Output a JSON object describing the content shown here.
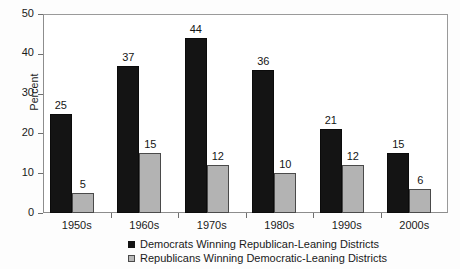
{
  "chart_data": {
    "type": "bar",
    "title": "",
    "xlabel": "",
    "ylabel": "Percent",
    "ylim": [
      0,
      50
    ],
    "yticks": [
      0,
      10,
      20,
      30,
      40,
      50
    ],
    "grid": false,
    "legend_position": "bottom",
    "categories": [
      "1950s",
      "1960s",
      "1970s",
      "1980s",
      "1990s",
      "2000s"
    ],
    "series": [
      {
        "name": "Democrats Winning Republican-Leaning Districts",
        "color": "#141414",
        "values": [
          25,
          37,
          44,
          36,
          21,
          15
        ]
      },
      {
        "name": "Republicans Winning Democratic-Leaning Districts",
        "color": "#b3b3b3",
        "values": [
          5,
          15,
          12,
          10,
          12,
          6
        ]
      }
    ]
  }
}
